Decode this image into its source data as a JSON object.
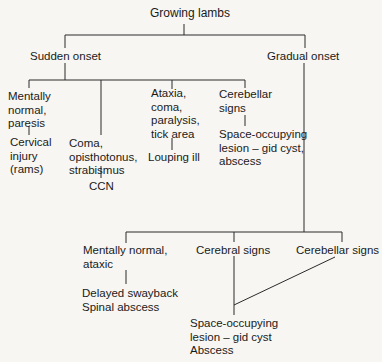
{
  "diagram": {
    "root": "Growing lambs",
    "branches": {
      "sudden": {
        "label": "Sudden onset",
        "children": [
          {
            "sign": "Mentally\nnormal,\nparesis",
            "diagnosis": "Cervical\ninjury\n(rams)"
          },
          {
            "sign": "Coma,\nopisthotonus,\nstrabismus",
            "diagnosis": "CCN"
          },
          {
            "sign": "Ataxia,\ncoma,\nparalysis,\ntick area",
            "diagnosis": "Louping ill"
          },
          {
            "sign": "Cerebellar\nsigns",
            "diagnosis": "Space-occupying\nlesion – gid cyst,\nabscess"
          }
        ]
      },
      "gradual": {
        "label": "Gradual onset",
        "children": [
          {
            "sign": "Mentally normal,\nataxic",
            "diagnosis": "Delayed swayback\nSpinal abscess"
          },
          {
            "sign": "Cerebral signs"
          },
          {
            "sign": "Cerebellar signs"
          }
        ],
        "shared_diagnosis": "Space-occupying\nlesion – gid cyst\nAbscess"
      }
    }
  },
  "colors": {
    "line": "#2a2a2a",
    "text": "#1a1a1a",
    "background": "#f7f6f3"
  }
}
